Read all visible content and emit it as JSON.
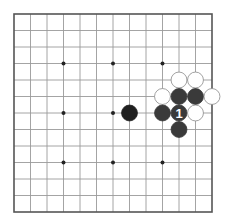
{
  "board": {
    "size": 13,
    "origin_x": 14,
    "origin_y": 14,
    "spacing": 16.5,
    "line_color": "#9a9a9a",
    "border_color": "#555555",
    "star_color": "#222222",
    "star_points": [
      [
        4,
        4
      ],
      [
        7,
        4
      ],
      [
        10,
        4
      ],
      [
        4,
        7
      ],
      [
        7,
        7
      ],
      [
        10,
        7
      ],
      [
        4,
        10
      ],
      [
        7,
        10
      ],
      [
        10,
        10
      ]
    ]
  },
  "colors": {
    "black_stone": "#3a3a3a",
    "black_stone_dark": "#1f1f1f",
    "white_stone": "#ffffff",
    "white_stone_edge": "#8a8a8a",
    "move_label": "#ffffff"
  },
  "stones": [
    {
      "color": "black",
      "col": 8,
      "row": 7,
      "shade": "dark",
      "label": ""
    },
    {
      "color": "white",
      "col": 11,
      "row": 5,
      "label": ""
    },
    {
      "color": "white",
      "col": 12,
      "row": 5,
      "label": ""
    },
    {
      "color": "white",
      "col": 10,
      "row": 6,
      "label": ""
    },
    {
      "color": "black",
      "col": 11,
      "row": 6,
      "label": ""
    },
    {
      "color": "black",
      "col": 12,
      "row": 6,
      "label": ""
    },
    {
      "color": "white",
      "col": 13,
      "row": 6,
      "label": ""
    },
    {
      "color": "black",
      "col": 10,
      "row": 7,
      "label": ""
    },
    {
      "color": "black",
      "col": 11,
      "row": 7,
      "label": "1"
    },
    {
      "color": "white",
      "col": 12,
      "row": 7,
      "label": ""
    },
    {
      "color": "black",
      "col": 11,
      "row": 8,
      "label": ""
    }
  ]
}
